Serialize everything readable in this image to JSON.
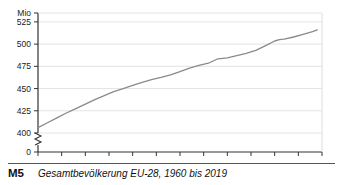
{
  "caption": {
    "key": "M5",
    "text": "Gesamtbevölkerung EU-28, 1960 bis 2019"
  },
  "colors": {
    "line": "#8a8a8a",
    "grid": "#d9d9d9",
    "axis": "#333333",
    "text": "#1a1a1a",
    "background": "#ffffff"
  },
  "chart_data": {
    "type": "line",
    "title": "Gesamtbevölkerung EU-28, 1960 bis 2019",
    "xlabel": "",
    "ylabel": "Mio",
    "unit_label": "Mio",
    "grid": true,
    "legend": "none",
    "axis_break": true,
    "axis_break_between": [
      0,
      400
    ],
    "xlim": [
      1960,
      2020
    ],
    "ylim": [
      400,
      535
    ],
    "yticks": [
      0,
      400,
      425,
      450,
      475,
      500,
      525
    ],
    "ytick_labels": [
      "0",
      "400",
      "425",
      "450",
      "475",
      "500",
      "525"
    ],
    "xticks": [
      1960,
      1965,
      1970,
      1975,
      1980,
      1985,
      1990,
      1995,
      2000,
      2005,
      2010,
      2015,
      2020
    ],
    "xtick_labels": [
      "1960",
      "1965",
      "1970",
      "1975",
      "1980",
      "1985",
      "1990",
      "1995",
      "2000",
      "2005",
      "2010",
      "2015",
      "2020"
    ],
    "series": [
      {
        "name": "Gesamtbevölkerung EU-28",
        "x": [
          1960,
          1962,
          1964,
          1966,
          1968,
          1970,
          1972,
          1974,
          1976,
          1978,
          1980,
          1982,
          1984,
          1986,
          1988,
          1990,
          1992,
          1994,
          1996,
          1997,
          1998,
          2000,
          2002,
          2004,
          2006,
          2008,
          2010,
          2011,
          2012,
          2014,
          2016,
          2018,
          2019
        ],
        "values": [
          406.0,
          411.5,
          417.0,
          422.5,
          427.5,
          432.5,
          437.5,
          442.0,
          446.5,
          450.0,
          453.5,
          457.0,
          460.0,
          462.5,
          465.5,
          469.0,
          473.0,
          476.0,
          478.5,
          481.0,
          483.5,
          484.5,
          487.0,
          489.5,
          493.0,
          498.0,
          503.5,
          505.0,
          505.5,
          508.0,
          511.0,
          514.0,
          516.0
        ]
      }
    ]
  }
}
